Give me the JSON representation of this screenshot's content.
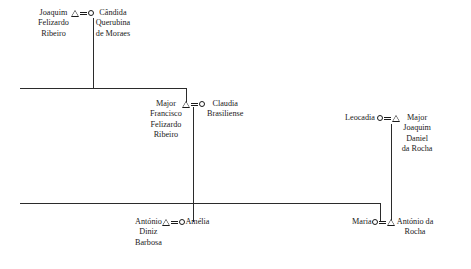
{
  "diagram": {
    "type": "kinship-genealogy-chart",
    "title": "",
    "symbols": {
      "male": "triangle",
      "female": "circle",
      "marriage": "equals-double-bar",
      "descent": "vertical-line",
      "sibling_bar": "horizontal-line"
    },
    "colors": {
      "background": "#ffffff",
      "ink": "#1a1a1a",
      "line": "#2b2b2b"
    },
    "unions": [
      {
        "id": "union-1",
        "left": {
          "sex": "male",
          "symbol": "triangle",
          "name_lines": [
            "Joaquim",
            "Felizardo",
            "Ribeiro"
          ]
        },
        "right": {
          "sex": "female",
          "symbol": "circle",
          "name_lines": [
            "Cândida",
            "Querubina",
            "de Moraes"
          ]
        }
      },
      {
        "id": "union-2",
        "left": {
          "sex": "male",
          "symbol": "triangle",
          "name_lines": [
            "Major",
            "Francisco",
            "Felizardo",
            "Ribeiro"
          ]
        },
        "right": {
          "sex": "female",
          "symbol": "circle",
          "name_lines": [
            "Claudia",
            "Brasiliense"
          ]
        }
      },
      {
        "id": "union-3",
        "left": {
          "sex": "female",
          "symbol": "circle",
          "name_lines": [
            "Leocadia"
          ]
        },
        "right": {
          "sex": "male",
          "symbol": "triangle",
          "name_lines": [
            "Major",
            "Joaquim",
            "Daniel",
            "da Rocha"
          ]
        }
      },
      {
        "id": "union-4",
        "left": {
          "sex": "male",
          "symbol": "triangle",
          "name_lines": [
            "António",
            "Diniz",
            "Barbosa"
          ]
        },
        "right": {
          "sex": "female",
          "symbol": "circle",
          "name_lines": [
            "Amélia"
          ]
        }
      },
      {
        "id": "union-5",
        "left": {
          "sex": "female",
          "symbol": "circle",
          "name_lines": [
            "Maria"
          ]
        },
        "right": {
          "sex": "male",
          "symbol": "triangle",
          "name_lines": [
            "António da",
            "Rocha"
          ]
        }
      }
    ]
  }
}
